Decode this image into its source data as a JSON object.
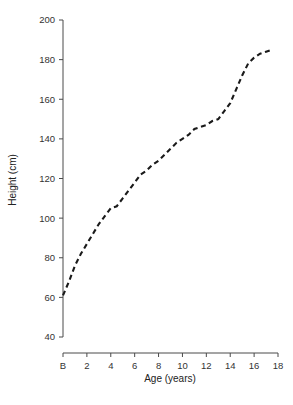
{
  "chart_data": {
    "type": "line",
    "title": "",
    "subtitle": "",
    "xlabel": "Age (years)",
    "ylabel": "Height (cm)",
    "xlim": [
      0,
      18
    ],
    "ylim": [
      40,
      200
    ],
    "grid": false,
    "legend": null,
    "legend_position": "none",
    "line_style": "dashed",
    "line_color": "#1a1a1a",
    "x_tick_labels": [
      "B",
      "2",
      "4",
      "6",
      "8",
      "10",
      "12",
      "14",
      "16",
      "18"
    ],
    "x_tick_values": [
      0,
      2,
      4,
      6,
      8,
      10,
      12,
      14,
      16,
      18
    ],
    "y_tick_labels": [
      "40",
      "60",
      "80",
      "100",
      "120",
      "140",
      "160",
      "180",
      "200"
    ],
    "y_tick_values": [
      40,
      60,
      80,
      100,
      120,
      140,
      160,
      180,
      200
    ],
    "series": [
      {
        "name": "Height",
        "x": [
          0,
          0.5,
          1,
          1.5,
          2,
          2.5,
          3,
          3.5,
          4,
          4.5,
          5,
          5.5,
          6,
          6.5,
          7,
          7.5,
          8,
          8.5,
          9,
          9.5,
          10,
          10.5,
          11,
          11.5,
          12,
          12.5,
          13,
          13.5,
          14,
          14.5,
          15,
          15.5,
          16,
          16.5,
          17,
          17.5
        ],
        "y": [
          61,
          68,
          76,
          82,
          87,
          92,
          97,
          101,
          105,
          106,
          110,
          114,
          118,
          122,
          124,
          127,
          129,
          132,
          135,
          138,
          140,
          142,
          145,
          146,
          147,
          149,
          150,
          154,
          158,
          165,
          172,
          178,
          181,
          183,
          184,
          185
        ]
      }
    ],
    "annotations": []
  },
  "axes": {
    "x_axis_name": "age-axis",
    "y_axis_name": "height-axis"
  }
}
